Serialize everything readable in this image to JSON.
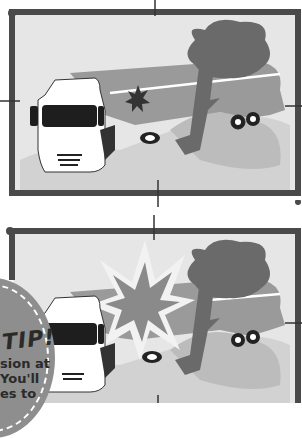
{
  "panels": [
    {
      "name": "original-scene",
      "description": "Truck crashed into a tree with small impact spark"
    },
    {
      "name": "modified-scene",
      "description": "Truck crashed into a tree with large explosion burst"
    }
  ],
  "tip": {
    "title": "TIP!",
    "lines": [
      "sion at",
      "You'll",
      "es to"
    ]
  },
  "colors": {
    "frame": "#4a4a4a",
    "background": "#e6e6e6",
    "ground": "#c4c4c4",
    "tanker": "#9a9a9a",
    "tree": "#6a6a6a",
    "truck": "#ffffff",
    "tip_badge": "#8e8e8e"
  }
}
